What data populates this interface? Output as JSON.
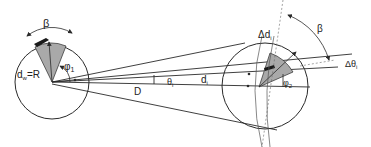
{
  "diagram": {
    "labels": {
      "beta_left": "β",
      "dw_eq_R": "d",
      "dw_sub": "w",
      "dw_tail": "=R",
      "phi1": "φ",
      "phi1_sub": "1",
      "D": "D",
      "theta_i": "θ",
      "theta_i_sub": "i",
      "d_i": "d",
      "d_i_sub": "i",
      "delta_d_i": "Δd",
      "delta_d_i_sub": "i",
      "beta_right": "β",
      "delta_theta_i": "Δθ",
      "delta_theta_i_sub": "i",
      "phi2": "φ",
      "phi2_sub": "2"
    },
    "colors": {
      "stroke": "#2a2a2a",
      "sector_fill": "#a9a9a9",
      "background": "#ffffff"
    }
  }
}
